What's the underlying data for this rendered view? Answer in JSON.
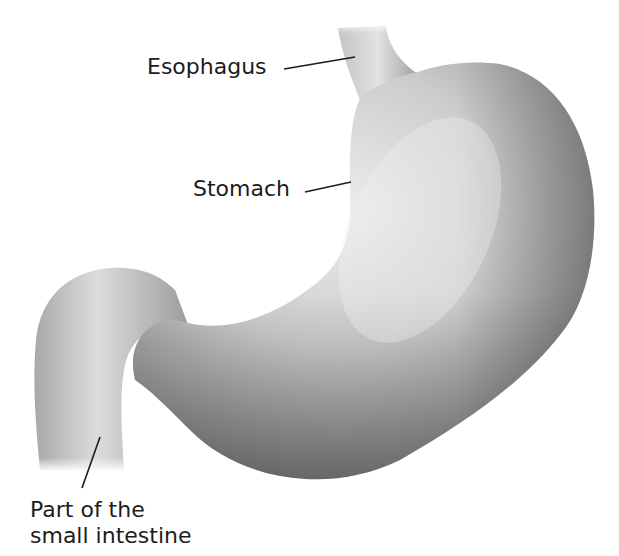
{
  "figure": {
    "colors": {
      "background": "#ffffff",
      "organ_light": "#e6e6e6",
      "organ_mid": "#b4b4b4",
      "organ_dark": "#6e6e6e",
      "label_text": "#1c1c1c",
      "leader_line": "#1c1c1c"
    }
  },
  "labels": {
    "esophagus": "Esophagus",
    "stomach": "Stomach",
    "intestine_line1": "Part of the",
    "intestine_line2": "small intestine"
  }
}
